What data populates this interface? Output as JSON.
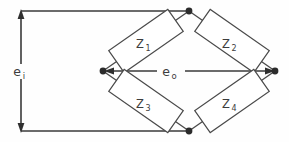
{
  "diagram": {
    "background_color": "#fefefe",
    "line_color": "#3a3a3a",
    "text_color": "#3d3d3d",
    "labels": {
      "input_voltage": {
        "base": "e",
        "subscript": "i",
        "full": "e_i"
      },
      "output_voltage": {
        "base": "e",
        "subscript": "o",
        "full": "e_o"
      }
    },
    "impedances": [
      {
        "id": "z1",
        "base": "Z",
        "subscript": "1",
        "full": "Z1",
        "position": "upper-left"
      },
      {
        "id": "z2",
        "base": "Z",
        "subscript": "2",
        "full": "Z2",
        "position": "upper-right"
      },
      {
        "id": "z3",
        "base": "Z",
        "subscript": "3",
        "full": "Z3",
        "position": "lower-left"
      },
      {
        "id": "z4",
        "base": "Z",
        "subscript": "4",
        "full": "Z4",
        "position": "lower-right"
      }
    ],
    "nodes": [
      {
        "id": "top",
        "x": 189,
        "y": 11
      },
      {
        "id": "left",
        "x": 103,
        "y": 71
      },
      {
        "id": "right",
        "x": 275,
        "y": 71
      },
      {
        "id": "bottom",
        "x": 189,
        "y": 131
      }
    ]
  }
}
